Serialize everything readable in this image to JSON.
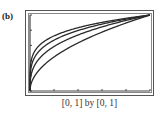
{
  "panel_label": "(b)",
  "caption": "[0, 1] by [0, 1]",
  "chart_data": {
    "type": "line",
    "title": "",
    "xlabel": "",
    "ylabel": "",
    "xlim": [
      0,
      1
    ],
    "ylim": [
      0,
      1
    ],
    "x_ticks": [
      0,
      0.2,
      0.4,
      0.6,
      0.8,
      1.0
    ],
    "y_ticks": [
      0,
      0.2,
      0.4,
      0.6,
      0.8,
      1.0
    ],
    "grid": false,
    "legend": false,
    "window": "[0, 1] by [0, 1]",
    "x": [
      0,
      0.01,
      0.05,
      0.1,
      0.2,
      0.3,
      0.4,
      0.5,
      0.6,
      0.7,
      0.8,
      0.9,
      1.0
    ],
    "series": [
      {
        "name": "y = x^(1/2)",
        "values": [
          0,
          0.1,
          0.224,
          0.316,
          0.447,
          0.548,
          0.632,
          0.707,
          0.775,
          0.837,
          0.894,
          0.949,
          1.0
        ]
      },
      {
        "name": "y = x^(1/3)",
        "values": [
          0,
          0.215,
          0.368,
          0.464,
          0.585,
          0.669,
          0.737,
          0.794,
          0.843,
          0.888,
          0.928,
          0.965,
          1.0
        ]
      },
      {
        "name": "y = x^(1/4)",
        "values": [
          0,
          0.316,
          0.473,
          0.562,
          0.669,
          0.74,
          0.795,
          0.841,
          0.88,
          0.915,
          0.946,
          0.974,
          1.0
        ]
      },
      {
        "name": "y = x^(1/5)",
        "values": [
          0,
          0.398,
          0.549,
          0.631,
          0.725,
          0.786,
          0.833,
          0.871,
          0.903,
          0.931,
          0.956,
          0.979,
          1.0
        ]
      }
    ],
    "colors": {
      "curve": "#2a2a2a",
      "axis": "#444444",
      "frame": "#555555"
    }
  }
}
